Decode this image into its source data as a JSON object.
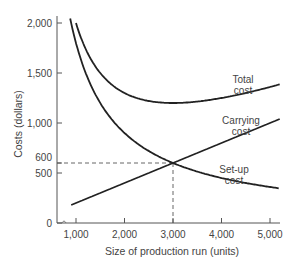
{
  "chart_data": {
    "type": "line",
    "title": "",
    "xlabel": "Size of production run (units)",
    "ylabel": "Costs (dollars)",
    "xlim": [
      700,
      5200
    ],
    "ylim": [
      0,
      2050
    ],
    "grid": false,
    "x_ticks": [
      1000,
      2000,
      3000,
      4000,
      5000
    ],
    "x_tick_labels": [
      "1,000",
      "2,000",
      "3,000",
      "4,000",
      "5,000"
    ],
    "y_ticks": [
      0,
      500,
      600,
      1000,
      1500,
      2000
    ],
    "y_tick_labels": [
      "0",
      "500",
      "600",
      "1,000",
      "1,500",
      "2,000"
    ],
    "series": [
      {
        "name": "Total cost",
        "label_lines": [
          "Total",
          "cost"
        ],
        "x": [
          1000,
          1200,
          1500,
          2000,
          2500,
          3000,
          3500,
          4000,
          4500,
          5000
        ],
        "values": [
          2000,
          1740,
          1500,
          1300,
          1220,
          1200,
          1214,
          1250,
          1300,
          1360
        ]
      },
      {
        "name": "Carrying cost",
        "label_lines": [
          "Carrying",
          "cost"
        ],
        "x": [
          1000,
          2000,
          3000,
          4000,
          5000
        ],
        "values": [
          200,
          400,
          600,
          800,
          1000
        ]
      },
      {
        "name": "Set-up cost",
        "label_lines": [
          "Set-up",
          "cost"
        ],
        "x": [
          900,
          1200,
          1500,
          2000,
          2500,
          3000,
          3500,
          4000,
          4500,
          5000
        ],
        "values": [
          2000,
          1500,
          1200,
          900,
          720,
          600,
          514,
          450,
          400,
          360
        ]
      }
    ],
    "annotations": [
      {
        "type": "reference-point",
        "x": 3000,
        "y": 600,
        "style": "dashed",
        "note": "intersection of carrying and set-up cost"
      }
    ],
    "legend": "inline labels"
  }
}
